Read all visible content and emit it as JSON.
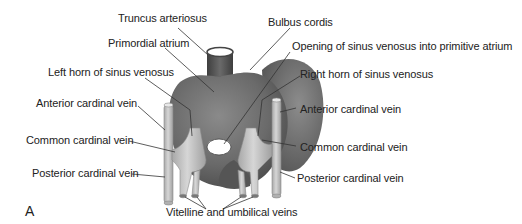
{
  "figure": {
    "panel_letter": "A",
    "colors": {
      "heart_dark": "#5f5f5f",
      "heart_mid": "#7a7a7a",
      "vein_light": "#c8c8c8",
      "opening": "#ffffff",
      "leader_line": "#333333",
      "text": "#222222"
    },
    "labels": {
      "truncus_arteriosus": "Truncus arteriosus",
      "bulbus_cordis": "Bulbus cordis",
      "primordial_atrium": "Primordial atrium",
      "opening_sinus_venosus": "Opening of sinus venosus into primitive atrium",
      "left_horn": "Left horn of sinus venosus",
      "right_horn": "Right horn of sinus venosus",
      "anterior_cardinal_left": "Anterior cardinal vein",
      "anterior_cardinal_right": "Anterior cardinal vein",
      "common_cardinal_left": "Common cardinal vein",
      "common_cardinal_right": "Common cardinal vein",
      "posterior_cardinal_left": "Posterior cardinal vein",
      "posterior_cardinal_right": "Posterior cardinal vein",
      "vitelline_umbilical": "Vitelline and umbilical veins"
    }
  }
}
